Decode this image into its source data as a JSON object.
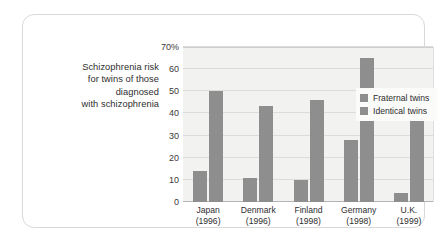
{
  "figure": {
    "caption_lines": [
      "Schizophrenia risk",
      "for twins of those",
      "diagnosed",
      "with schizophrenia"
    ],
    "bar_color": "#8e8e8e",
    "plot_background": "#f2f2f0",
    "gridline_color": "#dcdcda",
    "frame_color": "#d8d8d6"
  },
  "chart_data": {
    "type": "bar",
    "xlabel": "",
    "ylabel": "",
    "ylim": [
      0,
      70
    ],
    "yticks": [
      0,
      10,
      20,
      30,
      40,
      50,
      60,
      70
    ],
    "ytick_labels": [
      "0",
      "10",
      "20",
      "30",
      "40",
      "50",
      "60",
      "70%"
    ],
    "grid": true,
    "legend_position": "top-left",
    "categories": [
      "Japan",
      "Denmark",
      "Finland",
      "Germany",
      "U.K."
    ],
    "category_years": [
      "(1996)",
      "(1996)",
      "(1998)",
      "(1998)",
      "(1999)"
    ],
    "category_labels": [
      "Japan (1996)",
      "Denmark (1996)",
      "Finland (1998)",
      "Germany (1998)",
      "U.K. (1999)"
    ],
    "series": [
      {
        "name": "Fraternal twins",
        "color": "#8e8e8e",
        "values": [
          14,
          11,
          10,
          28,
          4
        ]
      },
      {
        "name": "Identical twins",
        "color": "#8e8e8e",
        "values": [
          50,
          43.5,
          46,
          65,
          42
        ]
      }
    ]
  }
}
